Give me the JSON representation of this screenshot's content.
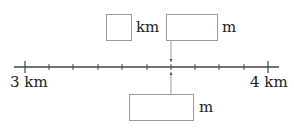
{
  "diagram": {
    "type": "number-line",
    "start_label": "3 km",
    "end_label": "4 km",
    "start_value_m": 3000,
    "end_value_m": 4000,
    "intervals": 10,
    "interval_value_m": 100,
    "marked_tick_index": 6,
    "top_answer": {
      "km_box_value": "",
      "km_unit": "km",
      "m_box_value": "",
      "m_unit": "m"
    },
    "bottom_answer": {
      "m_box_value": "",
      "m_unit": "m"
    }
  },
  "colors": {
    "line": "#444444",
    "box_border": "#9a9a9a",
    "connector": "#9a9a9a",
    "text": "#222222"
  }
}
